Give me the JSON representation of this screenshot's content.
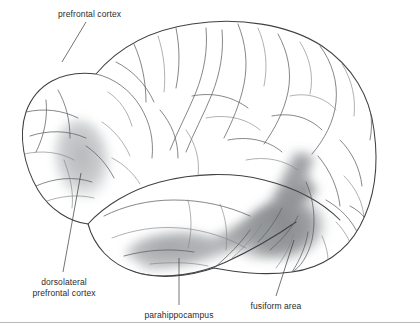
{
  "figure": {
    "background_color": "#ffffff",
    "width": 420,
    "height": 335
  },
  "labels": [
    {
      "id": "prefrontal-cortex",
      "text": "prefrontal cortex",
      "lines": [
        "prefrontal cortex"
      ],
      "x": 58,
      "y": 9,
      "align": "left",
      "leader": {
        "x1": 86,
        "y1": 22,
        "x2": 62,
        "y2": 62
      }
    },
    {
      "id": "dorsolateral-prefrontal-cortex",
      "text": "dorsolateral prefrontal cortex",
      "lines": [
        "dorsolateral",
        "prefrontal cortex"
      ],
      "x": 18,
      "y": 277,
      "align": "center",
      "leader": {
        "x1": 81,
        "y1": 173,
        "x2": 63,
        "y2": 272
      }
    },
    {
      "id": "parahippocampus",
      "text": "parahippocampus",
      "lines": [
        "parahippocampus"
      ],
      "x": 148,
      "y": 310,
      "align": "center",
      "leader": {
        "x1": 179,
        "y1": 258,
        "x2": 179,
        "y2": 305
      }
    },
    {
      "id": "fusiform-area",
      "text": "fusiform area",
      "lines": [
        "fusiform area"
      ],
      "x": 265,
      "y": 301,
      "align": "center",
      "leader": {
        "x1": 294,
        "y1": 240,
        "x2": 276,
        "y2": 296
      }
    }
  ],
  "regions": [
    {
      "id": "dorsolateral-prefrontal-shade",
      "name": "dorsolateral prefrontal cortex",
      "shade_color": "#b9bcbd",
      "opacity": 0.85
    },
    {
      "id": "parahippocampus-shade",
      "name": "parahippocampus",
      "shade_color": "#a3a6a8",
      "opacity": 0.9
    },
    {
      "id": "fusiform-shade",
      "name": "fusiform area",
      "shade_color": "#8e9194",
      "opacity": 0.95
    }
  ],
  "colors": {
    "outline": "#3f4145",
    "sulcus": "#5d5f63",
    "sulcus_faint": "#84868b",
    "cortex_fill": "#fbfbfc",
    "text": "#2b2b2b",
    "rule": "#b9b9bb"
  },
  "divider": {
    "y": 322
  }
}
